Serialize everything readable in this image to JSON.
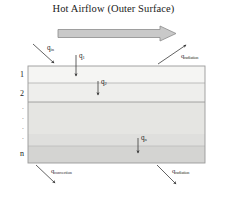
{
  "diagram": {
    "title": "Hot Airflow (Outer Surface)",
    "flow_arrow": {
      "name": "airflow-arrow",
      "fill": "#c9c9c9",
      "stroke": "#8c8c8c"
    },
    "slab": {
      "border_color": "#9a9a9a",
      "x": 28,
      "y": 66,
      "width": 177,
      "height": 97,
      "layers": [
        {
          "label": "1",
          "fill": "#f4f4f2",
          "top": 66,
          "height": 17
        },
        {
          "label": "2",
          "fill": "#ededeb",
          "top": 83,
          "height": 19
        },
        {
          "label": "",
          "fill": "#e4e4e1",
          "top": 102,
          "height": 32
        },
        {
          "label": "",
          "fill": "#dedede",
          "top": 134,
          "height": 12
        },
        {
          "label": "n",
          "fill": "#d4d4d2",
          "top": 146,
          "height": 17
        }
      ]
    },
    "layer_indices": [
      "1",
      "2",
      "n"
    ],
    "ellipsis": "·",
    "heat_flux_labels": {
      "q_in": {
        "base": "q",
        "sub": "in"
      },
      "q_1": {
        "base": "q",
        "sub": "1"
      },
      "q_2": {
        "base": "q",
        "sub": "2"
      },
      "q_n": {
        "base": "q",
        "sub": "n"
      },
      "q_radiation_top": {
        "base": "q",
        "sub": "radiation"
      },
      "q_convection_bottom": {
        "base": "q",
        "sub": "convection"
      },
      "q_radiation_bottom": {
        "base": "q",
        "sub": "radiation"
      }
    },
    "arrow_color": "#3b3b3b"
  }
}
